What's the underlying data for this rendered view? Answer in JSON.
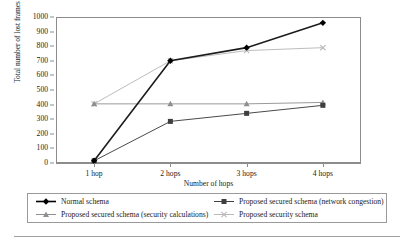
{
  "chart_data": {
    "type": "line",
    "title": "",
    "xlabel": "Number of hops",
    "ylabel": "Total number of lost frames",
    "categories": [
      "1 hop",
      "2 hops",
      "3 hops",
      "4 hops"
    ],
    "ylim": [
      0,
      1000
    ],
    "ytick_step": 100,
    "yticks": [
      "1000",
      "900",
      "800",
      "700",
      "600",
      "500",
      "400",
      "300",
      "200",
      "100",
      "0"
    ],
    "grid": "horizontal",
    "legend_position": "bottom",
    "series": [
      {
        "name": "Normal schema",
        "values": [
          15,
          700,
          790,
          960
        ],
        "marker": "diamond",
        "color": "#000000",
        "line_color": "#1c1c1c",
        "line_width": 1.6
      },
      {
        "name": "Proposed secured schema (network congestion)",
        "values": [
          15,
          285,
          340,
          395
        ],
        "marker": "square",
        "color": "#3f3f3f",
        "line_color": "#4a4a4a",
        "line_width": 1.0
      },
      {
        "name": "Proposed secured schema (security calculations)",
        "values": [
          405,
          405,
          405,
          415
        ],
        "marker": "triangle",
        "color": "#8f8f8f",
        "line_color": "#9a9a9a",
        "line_width": 1.0
      },
      {
        "name": "Proposed security schema",
        "values": [
          405,
          700,
          770,
          790
        ],
        "marker": "cross",
        "color": "#b9b9b9",
        "line_color": "#bdbdbd",
        "line_width": 1.0
      }
    ]
  },
  "legend": {
    "items": [
      {
        "label": "Normal schema",
        "marker": "diamond",
        "color": "#000000"
      },
      {
        "label": "Proposed secured schema (network congestion)",
        "marker": "square",
        "color": "#3f3f3f"
      },
      {
        "label": "Proposed secured schema (security calculations)",
        "marker": "triangle",
        "color": "#8f8f8f"
      },
      {
        "label": "Proposed security schema",
        "marker": "cross",
        "color": "#b9b9b9"
      }
    ]
  },
  "style": {
    "grid_color": "#c9c9c9",
    "axis_color": "#8c8c8c",
    "text_color": "#1a1a1a",
    "background": "#ffffff"
  }
}
